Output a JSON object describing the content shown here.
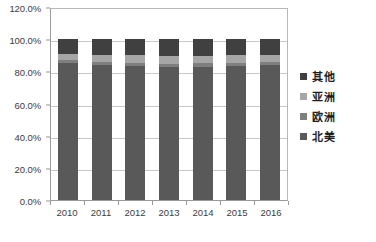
{
  "chart_data": {
    "type": "bar",
    "subtype": "100% stacked column",
    "title": "",
    "xlabel": "",
    "ylabel": "",
    "categories": [
      "2010",
      "2011",
      "2012",
      "2013",
      "2014",
      "2015",
      "2016"
    ],
    "series": [
      {
        "name": "北美",
        "color": "#595959",
        "values": [
          85.0,
          84.0,
          83.5,
          82.5,
          83.0,
          83.5,
          84.0
        ]
      },
      {
        "name": "欧洲",
        "color": "#7f7f7f",
        "values": [
          2.0,
          2.0,
          2.0,
          2.0,
          2.0,
          2.0,
          2.0
        ]
      },
      {
        "name": "亚洲",
        "color": "#a6a6a6",
        "values": [
          3.5,
          4.0,
          4.5,
          5.0,
          4.5,
          4.5,
          4.0
        ]
      },
      {
        "name": "其他",
        "color": "#404040",
        "values": [
          9.5,
          10.0,
          10.0,
          10.5,
          10.5,
          10.0,
          10.0
        ]
      }
    ],
    "ylim": [
      0,
      120
    ],
    "ytick_values": [
      0,
      20,
      40,
      60,
      80,
      100,
      120
    ],
    "ytick_labels": [
      "0.0%",
      "20.0%",
      "40.0%",
      "60.0%",
      "80.0%",
      "100.0%",
      "120.0%"
    ],
    "grid": true,
    "legend_position": "right",
    "legend_order": [
      "其他",
      "亚洲",
      "欧洲",
      "北美"
    ]
  },
  "axes": {
    "y_ticks": [
      {
        "label": "120.0%",
        "value": 120
      },
      {
        "label": "100.0%",
        "value": 100
      },
      {
        "label": "80.0%",
        "value": 80
      },
      {
        "label": "60.0%",
        "value": 60
      },
      {
        "label": "40.0%",
        "value": 40
      },
      {
        "label": "20.0%",
        "value": 20
      },
      {
        "label": "0.0%",
        "value": 0
      }
    ],
    "x_ticks": [
      "2010",
      "2011",
      "2012",
      "2013",
      "2014",
      "2015",
      "2016"
    ]
  },
  "legend": {
    "items": [
      {
        "label": "其他",
        "color": "#404040"
      },
      {
        "label": "亚洲",
        "color": "#a6a6a6"
      },
      {
        "label": "欧洲",
        "color": "#7f7f7f"
      },
      {
        "label": "北美",
        "color": "#595959"
      }
    ]
  },
  "caption": {
    "text": ""
  }
}
